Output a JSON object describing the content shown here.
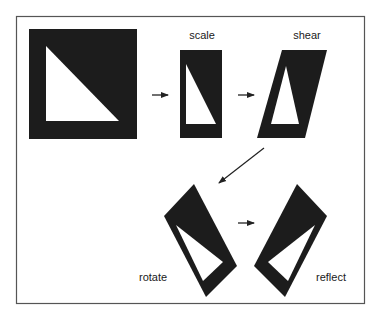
{
  "diagram": {
    "labels": {
      "scale": "scale",
      "shear": "shear",
      "rotate": "rotate",
      "reflect": "reflect"
    },
    "colors": {
      "shape_fill": "#1c1c1c",
      "hole_fill": "#ffffff",
      "frame": "#555555",
      "arrow": "#222222"
    },
    "steps": [
      "original",
      "scale",
      "shear",
      "rotate",
      "reflect"
    ]
  }
}
